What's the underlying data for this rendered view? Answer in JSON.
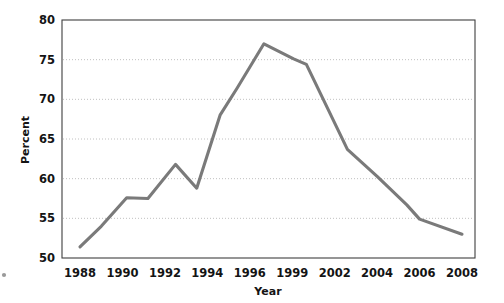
{
  "chart_data": {
    "type": "line",
    "title": "",
    "subtitle": "",
    "xlabel": "Year",
    "ylabel": "Percent",
    "xlim": [
      1987.2,
      2008.6
    ],
    "ylim": [
      50,
      80
    ],
    "yticks": [
      50,
      55,
      60,
      65,
      70,
      75,
      80
    ],
    "ytick_labels": [
      "50",
      "55",
      "60",
      "65",
      "70",
      "75",
      "80"
    ],
    "xticks": [
      1988,
      1990,
      1992,
      1994,
      1996,
      1999,
      2002,
      2004,
      2006,
      2008
    ],
    "xtick_labels": [
      "1988",
      "1990",
      "1992",
      "1994",
      "1996",
      "1999",
      "2002",
      "2004",
      "2006",
      "2008"
    ],
    "grid": "horizontal-dotted",
    "legend": "none",
    "line_color": "#7a7a7a",
    "series": [
      {
        "name": "Percent",
        "x": [
          1988.0,
          1989.0,
          1990.2,
          1991.2,
          1992.5,
          1993.5,
          1994.6,
          1995.4,
          1997.0,
          1999.1,
          2000.0,
          2002.6,
          2004.0,
          2005.4,
          2006.0,
          2008.0
        ],
        "values": [
          51.4,
          54.0,
          57.6,
          57.5,
          61.8,
          58.8,
          68.0,
          71.4,
          77.0,
          75.1,
          74.4,
          63.7,
          60.3,
          56.7,
          54.9,
          53.0
        ]
      }
    ]
  },
  "axes": {
    "ylabel_text": "Percent",
    "xlabel_text": "Year"
  }
}
